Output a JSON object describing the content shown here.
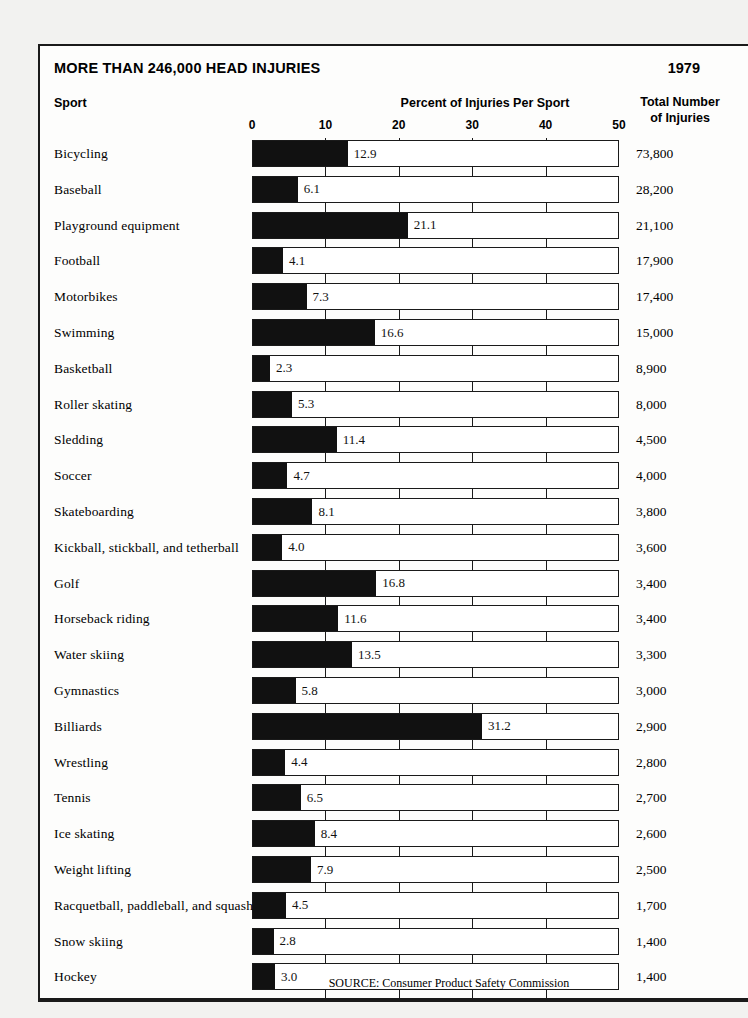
{
  "header": {
    "headline": "MORE THAN 246,000 HEAD INJURIES",
    "year": "1979"
  },
  "columns": {
    "sport": "Sport",
    "axis_title": "Percent of Injuries Per Sport",
    "totals_line1": "Total Number",
    "totals_line2": "of Injuries"
  },
  "source": "SOURCE: Consumer Product Safety Commission",
  "colors": {
    "bar_fill": "#111111",
    "frame": "#1a1a1a",
    "panel_background": "#fdfdfc",
    "page_background": "#f2f2f0"
  },
  "chart_data": {
    "type": "bar",
    "title": "MORE THAN 246,000 HEAD INJURIES",
    "subtitle": "1979",
    "orientation": "horizontal",
    "xlabel": "Percent of Injuries Per Sport",
    "ylabel": "Sport",
    "xlim": [
      0,
      50
    ],
    "xticks": [
      0,
      10,
      20,
      30,
      40,
      50
    ],
    "xtick_labels": [
      "0",
      "10",
      "20",
      "30",
      "40",
      "50"
    ],
    "grid": true,
    "legend": null,
    "value_series_name": "Percent of Injuries Per Sport",
    "annotation_series_name": "Total Number of Injuries",
    "categories": [
      "Bicycling",
      "Baseball",
      "Playground equipment",
      "Football",
      "Motorbikes",
      "Swimming",
      "Basketball",
      "Roller skating",
      "Sledding",
      "Soccer",
      "Skateboarding",
      "Kickball, stickball, and tetherball",
      "Golf",
      "Horseback riding",
      "Water skiing",
      "Gymnastics",
      "Billiards",
      "Wrestling",
      "Tennis",
      "Ice skating",
      "Weight lifting",
      "Racquetball, paddleball, and squash",
      "Snow skiing",
      "Hockey"
    ],
    "values": [
      12.9,
      6.1,
      21.1,
      4.1,
      7.3,
      16.6,
      2.3,
      5.3,
      11.4,
      4.7,
      8.1,
      4.0,
      16.8,
      11.6,
      13.5,
      5.8,
      31.2,
      4.4,
      6.5,
      8.4,
      7.9,
      4.5,
      2.8,
      3.0
    ],
    "value_labels": [
      "12.9",
      "6.1",
      "21.1",
      "4.1",
      "7.3",
      "16.6",
      "2.3",
      "5.3",
      "11.4",
      "4.7",
      "8.1",
      "4.0",
      "16.8",
      "11.6",
      "13.5",
      "5.8",
      "31.2",
      "4.4",
      "6.5",
      "8.4",
      "7.9",
      "4.5",
      "2.8",
      "3.0"
    ],
    "totals": [
      "73,800",
      "28,200",
      "21,100",
      "17,900",
      "17,400",
      "15,000",
      "8,900",
      "8,000",
      "4,500",
      "4,000",
      "3,800",
      "3,600",
      "3,400",
      "3,400",
      "3,300",
      "3,000",
      "2,900",
      "2,800",
      "2,700",
      "2,600",
      "2,500",
      "1,700",
      "1,400",
      "1,400"
    ]
  }
}
